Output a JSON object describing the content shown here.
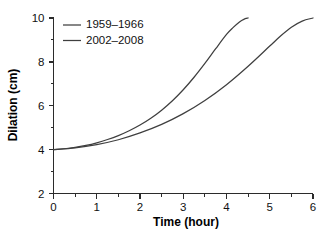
{
  "chart_data": {
    "type": "line",
    "title": "",
    "xlabel": "Time (hour)",
    "ylabel": "Dilation (cm)",
    "xlim": [
      0,
      6
    ],
    "ylim": [
      2,
      10
    ],
    "grid": false,
    "legend_position": "top-left",
    "x_ticks": [
      "0",
      "1",
      "2",
      "3",
      "4",
      "5",
      "6"
    ],
    "x_tick_values": [
      0,
      1,
      2,
      3,
      4,
      5,
      6
    ],
    "x_minor_tick_values": [
      0.5,
      1.5,
      2.5,
      3.5,
      4.5,
      5.5
    ],
    "y_ticks": [
      "2",
      "4",
      "6",
      "8",
      "10"
    ],
    "y_tick_values": [
      2,
      4,
      6,
      8,
      10
    ],
    "y_minor_tick_values": [
      3,
      5,
      7,
      9
    ],
    "series": [
      {
        "name": "1959–1966",
        "color": "#3f3f3f",
        "x": [
          0,
          0.25,
          0.5,
          0.75,
          1,
          1.25,
          1.5,
          1.75,
          2,
          2.25,
          2.5,
          2.75,
          3,
          3.25,
          3.5,
          3.75,
          4,
          4.15,
          4.3,
          4.4,
          4.5
        ],
        "y": [
          4.0,
          4.04,
          4.1,
          4.19,
          4.31,
          4.46,
          4.64,
          4.86,
          5.12,
          5.43,
          5.8,
          6.23,
          6.73,
          7.3,
          7.93,
          8.6,
          9.25,
          9.56,
          9.82,
          9.94,
          10.0
        ]
      },
      {
        "name": "2002–2008",
        "color": "#3f3f3f",
        "x": [
          0,
          0.5,
          1,
          1.5,
          2,
          2.5,
          3,
          3.5,
          4,
          4.5,
          5,
          5.25,
          5.5,
          5.75,
          6
        ],
        "y": [
          4.0,
          4.08,
          4.23,
          4.45,
          4.76,
          5.15,
          5.64,
          6.24,
          6.96,
          7.8,
          8.72,
          9.18,
          9.58,
          9.86,
          10.0
        ]
      }
    ]
  },
  "legend": {
    "entries": [
      {
        "label": "1959–1966"
      },
      {
        "label": "2002–2008"
      }
    ]
  }
}
